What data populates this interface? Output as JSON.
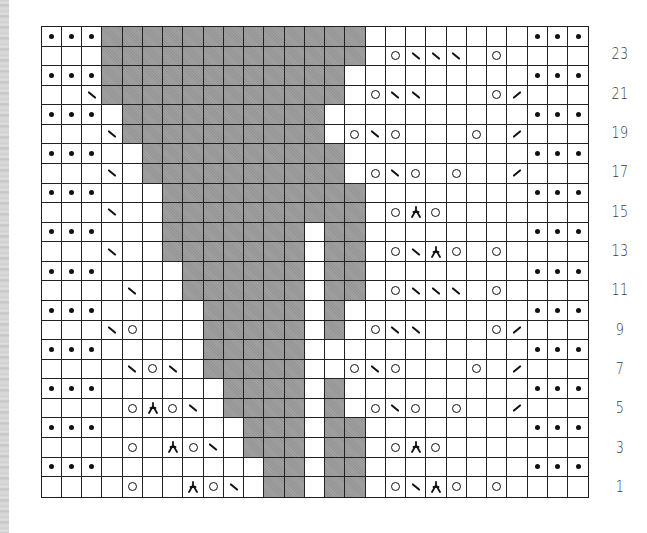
{
  "chart": {
    "columns": 27,
    "rows": 24,
    "colors": {
      "background": "#ffffff",
      "shaded": "#9c9c9c",
      "grid_line": "#222222",
      "symbol": "#111111",
      "label": "#3a3a3a"
    },
    "symbol_legend": {
      "dot": "purl (•)",
      "yo": "yarn over (○)",
      "ssk": "left-leaning decrease (\\)",
      "k2tog": "right-leaning decrease (/)",
      "sk2p": "centered double decrease (⅄)",
      "gray": "no stitch (shaded)"
    },
    "row_labels": [
      {
        "row": 23,
        "label": "23"
      },
      {
        "row": 21,
        "label": "21"
      },
      {
        "row": 19,
        "label": "19"
      },
      {
        "row": 17,
        "label": "17"
      },
      {
        "row": 15,
        "label": "15"
      },
      {
        "row": 13,
        "label": "13"
      },
      {
        "row": 11,
        "label": "11"
      },
      {
        "row": 9,
        "label": "9"
      },
      {
        "row": 7,
        "label": "7"
      },
      {
        "row": 5,
        "label": "5"
      },
      {
        "row": 3,
        "label": "3"
      },
      {
        "row": 1,
        "label": "1"
      }
    ],
    "grid_rows_top_to_bottom": [
      {
        "row": 24,
        "gray": [
          3,
          15
        ],
        "gray2": null,
        "symbols": {
          "0": "dot",
          "1": "dot",
          "2": "dot",
          "24": "dot",
          "25": "dot",
          "26": "dot"
        }
      },
      {
        "row": 23,
        "gray": [
          3,
          15
        ],
        "gray2": null,
        "symbols": {
          "17": "yo",
          "18": "ssk",
          "19": "ssk",
          "20": "ssk",
          "22": "yo"
        }
      },
      {
        "row": 22,
        "gray": [
          3,
          14
        ],
        "gray2": null,
        "symbols": {
          "0": "dot",
          "1": "dot",
          "2": "dot",
          "24": "dot",
          "25": "dot",
          "26": "dot"
        }
      },
      {
        "row": 21,
        "gray": [
          3,
          14
        ],
        "gray2": null,
        "symbols": {
          "2": "ssk",
          "16": "yo",
          "17": "ssk",
          "18": "ssk",
          "22": "yo",
          "23": "k2tog"
        }
      },
      {
        "row": 20,
        "gray": [
          4,
          13
        ],
        "gray2": null,
        "symbols": {
          "0": "dot",
          "1": "dot",
          "2": "dot",
          "24": "dot",
          "25": "dot",
          "26": "dot"
        }
      },
      {
        "row": 19,
        "gray": [
          4,
          13
        ],
        "gray2": null,
        "symbols": {
          "3": "ssk",
          "15": "yo",
          "16": "ssk",
          "17": "yo",
          "21": "yo",
          "23": "k2tog"
        }
      },
      {
        "row": 18,
        "gray": [
          5,
          14
        ],
        "gray2": null,
        "symbols": {
          "0": "dot",
          "1": "dot",
          "2": "dot",
          "24": "dot",
          "25": "dot",
          "26": "dot"
        }
      },
      {
        "row": 17,
        "gray": [
          5,
          14
        ],
        "gray2": null,
        "symbols": {
          "3": "ssk",
          "16": "yo",
          "17": "ssk",
          "18": "yo",
          "20": "yo",
          "23": "k2tog"
        }
      },
      {
        "row": 16,
        "gray": [
          6,
          15
        ],
        "gray2": null,
        "symbols": {
          "0": "dot",
          "1": "dot",
          "2": "dot",
          "24": "dot",
          "25": "dot",
          "26": "dot"
        }
      },
      {
        "row": 15,
        "gray": [
          6,
          15
        ],
        "gray2": null,
        "symbols": {
          "3": "ssk",
          "17": "yo",
          "18": "sk2p",
          "19": "yo"
        }
      },
      {
        "row": 14,
        "gray": [
          6,
          12
        ],
        "gray2": [
          14,
          15
        ],
        "symbols": {
          "0": "dot",
          "1": "dot",
          "2": "dot",
          "24": "dot",
          "25": "dot",
          "26": "dot"
        }
      },
      {
        "row": 13,
        "gray": [
          6,
          12
        ],
        "gray2": [
          14,
          15
        ],
        "symbols": {
          "3": "ssk",
          "17": "yo",
          "18": "ssk",
          "19": "sk2p",
          "20": "yo",
          "22": "yo"
        }
      },
      {
        "row": 12,
        "gray": [
          7,
          12
        ],
        "gray2": [
          14,
          15
        ],
        "symbols": {
          "0": "dot",
          "1": "dot",
          "2": "dot",
          "24": "dot",
          "25": "dot",
          "26": "dot"
        }
      },
      {
        "row": 11,
        "gray": [
          7,
          12
        ],
        "gray2": [
          14,
          15
        ],
        "symbols": {
          "4": "ssk",
          "17": "yo",
          "18": "ssk",
          "19": "ssk",
          "20": "ssk",
          "22": "yo"
        }
      },
      {
        "row": 10,
        "gray": [
          8,
          12
        ],
        "gray2": [
          14,
          14
        ],
        "symbols": {
          "0": "dot",
          "1": "dot",
          "2": "dot",
          "24": "dot",
          "25": "dot",
          "26": "dot"
        }
      },
      {
        "row": 9,
        "gray": [
          8,
          12
        ],
        "gray2": [
          14,
          14
        ],
        "symbols": {
          "3": "ssk",
          "4": "yo",
          "16": "yo",
          "17": "ssk",
          "18": "ssk",
          "22": "yo",
          "23": "k2tog"
        }
      },
      {
        "row": 8,
        "gray": [
          8,
          12
        ],
        "gray2": null,
        "symbols": {
          "0": "dot",
          "1": "dot",
          "2": "dot",
          "24": "dot",
          "25": "dot",
          "26": "dot"
        }
      },
      {
        "row": 7,
        "gray": [
          8,
          12
        ],
        "gray2": null,
        "symbols": {
          "4": "ssk",
          "5": "yo",
          "6": "ssk",
          "15": "yo",
          "16": "ssk",
          "17": "yo",
          "21": "yo",
          "23": "k2tog"
        }
      },
      {
        "row": 6,
        "gray": [
          9,
          12
        ],
        "gray2": [
          14,
          14
        ],
        "symbols": {
          "0": "dot",
          "1": "dot",
          "2": "dot",
          "24": "dot",
          "25": "dot",
          "26": "dot"
        }
      },
      {
        "row": 5,
        "gray": [
          9,
          12
        ],
        "gray2": [
          14,
          14
        ],
        "symbols": {
          "4": "yo",
          "5": "sk2p",
          "6": "yo",
          "7": "ssk",
          "16": "yo",
          "17": "ssk",
          "18": "yo",
          "20": "yo",
          "23": "k2tog"
        }
      },
      {
        "row": 4,
        "gray": [
          10,
          12
        ],
        "gray2": [
          14,
          15
        ],
        "symbols": {
          "0": "dot",
          "1": "dot",
          "2": "dot",
          "24": "dot",
          "25": "dot",
          "26": "dot"
        }
      },
      {
        "row": 3,
        "gray": [
          10,
          12
        ],
        "gray2": [
          14,
          15
        ],
        "symbols": {
          "4": "yo",
          "6": "sk2p",
          "7": "yo",
          "8": "ssk",
          "17": "yo",
          "18": "sk2p",
          "19": "yo"
        }
      },
      {
        "row": 2,
        "gray": [
          11,
          12
        ],
        "gray2": [
          14,
          15
        ],
        "symbols": {
          "0": "dot",
          "1": "dot",
          "2": "dot",
          "24": "dot",
          "25": "dot",
          "26": "dot"
        }
      },
      {
        "row": 1,
        "gray": [
          11,
          12
        ],
        "gray2": [
          14,
          15
        ],
        "symbols": {
          "4": "yo",
          "7": "sk2p",
          "8": "yo",
          "9": "ssk",
          "17": "yo",
          "18": "ssk",
          "19": "sk2p",
          "20": "yo",
          "22": "yo"
        }
      }
    ]
  }
}
